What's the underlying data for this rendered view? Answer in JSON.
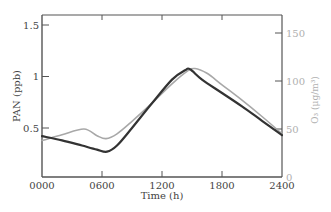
{
  "chart_data": {
    "type": "line",
    "title": "",
    "xlabel": "Time (h)",
    "ylabel": "PAN (ppb)",
    "ylabel_right": "O₃ (μg/m³)",
    "x_ticks": [
      "0000",
      "0600",
      "1200",
      "1800",
      "2400"
    ],
    "y_ticks_left": [
      "0.5",
      "1",
      "1.5"
    ],
    "y_ticks_right": [
      "0",
      "50",
      "100",
      "150"
    ],
    "xlim": [
      0,
      24
    ],
    "ylim_left": [
      0.22,
      1.6
    ],
    "ylim_right": [
      0,
      165
    ],
    "grid": false,
    "legend": null,
    "series": [
      {
        "name": "PAN",
        "axis": "left",
        "color": "#333333",
        "x": [
          0,
          2,
          4,
          5.5,
          6.5,
          7.5,
          9,
          11,
          13,
          14.3,
          14.8,
          16,
          18,
          20,
          22,
          24
        ],
        "values": [
          0.42,
          0.38,
          0.33,
          0.29,
          0.27,
          0.33,
          0.5,
          0.74,
          0.97,
          1.06,
          1.07,
          0.97,
          0.84,
          0.71,
          0.57,
          0.43
        ]
      },
      {
        "name": "O3",
        "axis": "right",
        "color": "#a8a8a8",
        "x": [
          0,
          2,
          4.2,
          5.5,
          6.4,
          7.5,
          9,
          11,
          13,
          14.5,
          15.3,
          16.5,
          18,
          20,
          22,
          24
        ],
        "values": [
          38,
          44,
          50,
          43,
          40,
          45,
          58,
          77,
          97,
          110,
          113,
          108,
          96,
          80,
          63,
          45
        ]
      }
    ]
  }
}
